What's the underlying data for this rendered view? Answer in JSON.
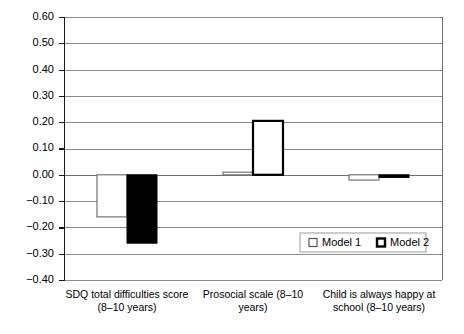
{
  "chart_data": {
    "type": "bar",
    "title": "",
    "subtitle": "",
    "xlabel": "",
    "ylabel": "",
    "ylim": [
      -0.4,
      0.6
    ],
    "ytick_step": 0.1,
    "grid": true,
    "legend_position": "inside-bottom-right",
    "categories": [
      "SDQ total difficulties score (8–10 years)",
      "Prosocial scale (8–10 years)",
      "Child is always happy at school (8–10 years)"
    ],
    "category_lines": [
      [
        "SDQ total difficulties score",
        "(8–10 years)"
      ],
      [
        "Prosocial scale (8–10",
        "years)"
      ],
      [
        "Child is always happy at",
        "school (8–10 years)"
      ]
    ],
    "ytick_labels": [
      "0.60",
      "0.50",
      "0.40",
      "0.30",
      "0.20",
      "0.10",
      "0.00",
      "−0.10",
      "−0.20",
      "−0.30",
      "−0.40"
    ],
    "ytick_values": [
      0.6,
      0.5,
      0.4,
      0.3,
      0.2,
      0.1,
      0.0,
      -0.1,
      -0.2,
      -0.3,
      -0.4
    ],
    "series": [
      {
        "name": "Model 1",
        "style": "hollow-gray",
        "values": [
          -0.16,
          0.01,
          -0.02
        ]
      },
      {
        "name": "Model 2",
        "style": "mixed",
        "values": [
          -0.26,
          0.205,
          -0.01
        ]
      }
    ]
  },
  "legend": {
    "items": [
      {
        "label": "Model 1",
        "marker": "hollow-square-gray"
      },
      {
        "label": "Model 2",
        "marker": "hollow-square-black"
      }
    ]
  }
}
